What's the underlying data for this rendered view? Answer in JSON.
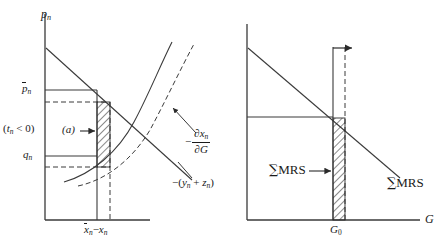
{
  "figure": {
    "name": "two-panel-public-goods-diagram",
    "panels": [
      {
        "id": "left-panel",
        "y_axis_label": "p_n",
        "x_axis_label": "x̄_n − x_n",
        "axis_labels": {
          "y_main": "p",
          "y_sub": "n",
          "x_first_main": "x",
          "x_first_sub": "n",
          "x_minus": "−",
          "x_second_main": "x",
          "x_second_sub": "n"
        },
        "tick_labels": [
          {
            "name": "p-bar-n",
            "main": "p",
            "sub": "n",
            "overbar": true
          },
          {
            "name": "q-n",
            "main": "q",
            "sub": "n",
            "overbar": false
          }
        ],
        "annotations": [
          {
            "name": "tax-note",
            "text": "(t_n < 0)",
            "parts": {
              "open": "(",
              "main": "t",
              "sub": "n",
              "rel": " < 0",
              "close": ")"
            }
          },
          {
            "name": "area-a-label",
            "text": "(a)"
          }
        ],
        "curve_labels": [
          {
            "name": "partial-x-partial-G",
            "minus": "−",
            "numerator_main": "∂x",
            "numerator_sub": "n",
            "denominator": "∂G"
          },
          {
            "name": "minus-y-plus-z",
            "text": "−(y_n + z_n)",
            "parts": {
              "lead": "−(",
              "first_main": "y",
              "first_sub": "n",
              "plus": " + ",
              "second_main": "z",
              "second_sub": "n",
              "close": ")"
            }
          }
        ]
      },
      {
        "id": "right-panel",
        "x_axis_label": "G",
        "tick_labels": [
          {
            "name": "G-zero",
            "main": "G",
            "sub": "0"
          }
        ],
        "curve_labels": [
          {
            "name": "sum-mrs-left",
            "sigma": "∑",
            "text": "MRS"
          },
          {
            "name": "sum-mrs-right",
            "sigma": "∑",
            "text": "MRS"
          }
        ]
      }
    ],
    "colors": {
      "line": "#2a2a2a",
      "axis": "#3a3a3a",
      "hatch": "#2a2a2a",
      "background": "#ffffff"
    }
  }
}
